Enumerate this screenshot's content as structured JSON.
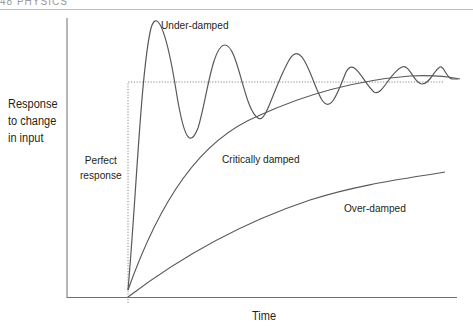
{
  "header": {
    "text": "48   PHYSICS"
  },
  "diagram": {
    "y_axis_label_lines": [
      "Response",
      "to change",
      "in input"
    ],
    "x_axis_label": "Time",
    "curves": [
      {
        "id": "perfect",
        "label_lines": [
          "Perfect",
          "response"
        ],
        "style": "dotted",
        "description": "Step: instant vertical jump to the final value, then flat"
      },
      {
        "id": "under",
        "label": "Under-damped",
        "style": "solid",
        "description": "Overshoots and oscillates with decaying amplitude about the final value"
      },
      {
        "id": "critical",
        "label": "Critically damped",
        "style": "solid",
        "description": "Rises fastest to the final value without overshoot"
      },
      {
        "id": "over",
        "label": "Over-damped",
        "style": "solid",
        "description": "Rises slowly toward the final value"
      }
    ],
    "colors": {
      "axis": "#6d6e71",
      "curve": "#58595b",
      "dotted": "#8a8a8a",
      "text": "#231f20"
    }
  }
}
